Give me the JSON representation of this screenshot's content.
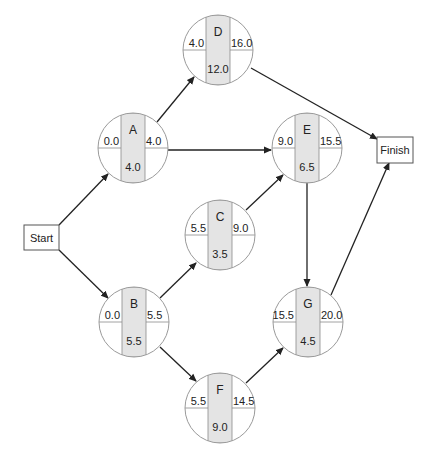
{
  "diagram": {
    "type": "activity-on-node network",
    "colors": {
      "circle_stroke": "#9a9a9a",
      "circle_fill": "#ffffff",
      "column_fill": "#e4e4e4",
      "divider": "#8a8a8a",
      "arrow": "#222222",
      "box_stroke": "#555555"
    },
    "terminals": [
      {
        "id": "start",
        "label": "Start",
        "x": 24,
        "y": 225,
        "w": 35,
        "h": 25
      },
      {
        "id": "finish",
        "label": "Finish",
        "x": 377,
        "y": 137,
        "w": 36,
        "h": 26
      }
    ],
    "nodes": [
      {
        "id": "A",
        "label": "A",
        "es": "0.0",
        "ef": "4.0",
        "duration": "4.0",
        "cx": 133,
        "cy": 148
      },
      {
        "id": "D",
        "label": "D",
        "es": "4.0",
        "ef": "16.0",
        "duration": "12.0",
        "cx": 218,
        "cy": 50
      },
      {
        "id": "E",
        "label": "E",
        "es": "9.0",
        "ef": "15.5",
        "duration": "6.5",
        "cx": 307,
        "cy": 148
      },
      {
        "id": "C",
        "label": "C",
        "es": "5.5",
        "ef": "9.0",
        "duration": "3.5",
        "cx": 220,
        "cy": 235
      },
      {
        "id": "B",
        "label": "B",
        "es": "0.0",
        "ef": "5.5",
        "duration": "5.5",
        "cx": 134,
        "cy": 322
      },
      {
        "id": "G",
        "label": "G",
        "es": "15.5",
        "ef": "20.0",
        "duration": "4.5",
        "cx": 308,
        "cy": 322
      },
      {
        "id": "F",
        "label": "F",
        "es": "5.5",
        "ef": "14.5",
        "duration": "9.0",
        "cx": 220,
        "cy": 408
      }
    ],
    "node_radius": 35,
    "column_half_width": 12,
    "edges": [
      {
        "from": "start",
        "to": "A",
        "x1": 59,
        "y1": 225,
        "x2": 108,
        "y2": 174
      },
      {
        "from": "start",
        "to": "B",
        "x1": 59,
        "y1": 250,
        "x2": 108,
        "y2": 298
      },
      {
        "from": "A",
        "to": "D",
        "x1": 157,
        "y1": 122,
        "x2": 194,
        "y2": 77
      },
      {
        "from": "A",
        "to": "E",
        "x1": 168,
        "y1": 150,
        "x2": 271,
        "y2": 150
      },
      {
        "from": "D",
        "to": "Finish",
        "x1": 251,
        "y1": 68,
        "x2": 377,
        "y2": 139
      },
      {
        "from": "E",
        "to": "Finish",
        "x1": 343,
        "y1": 150,
        "x2": 377,
        "y2": 150,
        "hidden": true
      },
      {
        "from": "B",
        "to": "C",
        "x1": 160,
        "y1": 298,
        "x2": 196,
        "y2": 263
      },
      {
        "from": "B",
        "to": "F",
        "x1": 160,
        "y1": 347,
        "x2": 196,
        "y2": 381
      },
      {
        "from": "C",
        "to": "E",
        "x1": 246,
        "y1": 210,
        "x2": 283,
        "y2": 175
      },
      {
        "from": "E",
        "to": "G",
        "x1": 307,
        "y1": 183,
        "x2": 307,
        "y2": 286
      },
      {
        "from": "F",
        "to": "G",
        "x1": 246,
        "y1": 383,
        "x2": 283,
        "y2": 348
      },
      {
        "from": "G",
        "to": "Finish",
        "x1": 331,
        "y1": 295,
        "x2": 389,
        "y2": 163
      }
    ]
  }
}
